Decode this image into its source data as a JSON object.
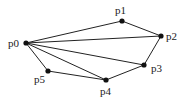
{
  "diagram": {
    "type": "polygon-triangulation",
    "nodes": [
      {
        "id": "p0",
        "label": "p0",
        "x": 26,
        "y": 43,
        "lx": 8,
        "ly": 47
      },
      {
        "id": "p1",
        "label": "p1",
        "x": 122,
        "y": 21,
        "lx": 115,
        "ly": 14
      },
      {
        "id": "p2",
        "label": "p2",
        "x": 161,
        "y": 36,
        "lx": 166,
        "ly": 40
      },
      {
        "id": "p3",
        "label": "p3",
        "x": 144,
        "y": 65,
        "lx": 151,
        "ly": 72
      },
      {
        "id": "p4",
        "label": "p4",
        "x": 106,
        "y": 80,
        "lx": 100,
        "ly": 95
      },
      {
        "id": "p5",
        "label": "p5",
        "x": 48,
        "y": 71,
        "lx": 34,
        "ly": 83
      }
    ],
    "edges": [
      [
        "p0",
        "p1"
      ],
      [
        "p1",
        "p2"
      ],
      [
        "p0",
        "p2"
      ],
      [
        "p2",
        "p3"
      ],
      [
        "p0",
        "p3"
      ],
      [
        "p3",
        "p4"
      ],
      [
        "p0",
        "p4"
      ],
      [
        "p4",
        "p5"
      ],
      [
        "p0",
        "p5"
      ]
    ]
  }
}
